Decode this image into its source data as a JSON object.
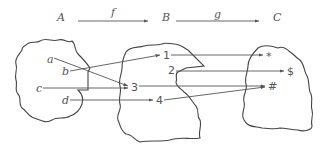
{
  "header": {
    "sets": [
      "A",
      "B",
      "C"
    ],
    "functions": [
      "f",
      "g"
    ]
  },
  "set_a": {
    "elements": [
      "a",
      "b",
      "c",
      "d"
    ]
  },
  "set_b": {
    "elements": [
      "1",
      "2",
      "3",
      "4"
    ]
  },
  "set_c": {
    "elements": [
      "*",
      "$",
      "#"
    ]
  },
  "mapping_f": [
    {
      "from": "a",
      "to": "3"
    },
    {
      "from": "b",
      "to": "1"
    },
    {
      "from": "c",
      "to": "3"
    },
    {
      "from": "d",
      "to": "4"
    }
  ],
  "mapping_g": [
    {
      "from": "1",
      "to": "*"
    },
    {
      "from": "2",
      "to": "$"
    },
    {
      "from": "3",
      "to": "#"
    },
    {
      "from": "4",
      "to": "#"
    }
  ],
  "colors": {
    "stroke": "#444444",
    "text": "#555555",
    "background": "#ffffff"
  }
}
